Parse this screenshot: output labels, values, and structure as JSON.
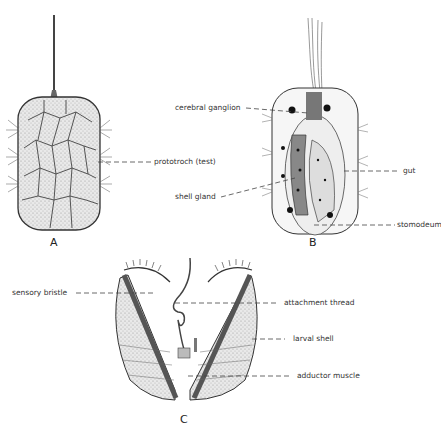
{
  "figures": [
    {
      "id": "A",
      "letter": "A",
      "labels": [
        {
          "text": "prototroch (test)"
        }
      ]
    },
    {
      "id": "B",
      "letter": "B",
      "labels": [
        {
          "text": "cerebral ganglion"
        },
        {
          "text": "gut"
        },
        {
          "text": "shell gland"
        },
        {
          "text": "stomodeum"
        }
      ]
    },
    {
      "id": "C",
      "letter": "C",
      "labels": [
        {
          "text": "sensory bristle"
        },
        {
          "text": "attachment thread"
        },
        {
          "text": "larval shell"
        },
        {
          "text": "adductor muscle"
        }
      ]
    }
  ]
}
